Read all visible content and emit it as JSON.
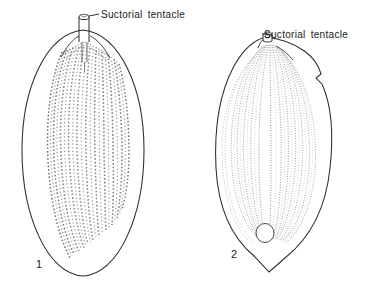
{
  "figure": {
    "kind": "scientific-line-illustration",
    "background_color": "#ffffff",
    "ink_color": "#1a1a1a",
    "hatching_color": "#8c8c8c",
    "panels": [
      {
        "number": "1",
        "number_label": "1",
        "outline_shape": "elongate-oval",
        "annotation": {
          "label": "Suctorial tentacle",
          "leader_from": [
            99,
            14
          ],
          "leader_to": [
            83,
            17
          ],
          "target": "tubular tentacle at apex"
        },
        "ornament": "arched longitudinal rows of short dashes",
        "tentacle_type": "long tubular",
        "aperture": "none"
      },
      {
        "number": "2",
        "number_label": "2",
        "outline_shape": "broad-oval-with-basal-point",
        "annotation": {
          "label": "Suctorial tentacle",
          "leader_from": [
            262,
            34
          ],
          "leader_to": [
            268,
            36
          ],
          "target": "small knob tentacle at apex"
        },
        "ornament": "fine longitudinal ribs (striae)",
        "tentacle_type": "short knob",
        "aperture": "circular pore near base"
      }
    ]
  },
  "labels": {
    "tentacle_1": "Suctorial tentacle",
    "tentacle_2": "Suctorial tentacle",
    "figure_1": "1",
    "figure_2": "2"
  }
}
